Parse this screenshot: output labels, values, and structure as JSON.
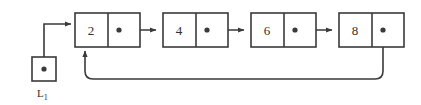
{
  "diagram": {
    "type": "circular-singly-linked-list",
    "colors": {
      "stroke": "#3a3a3a",
      "background": "#ffffff",
      "text": "#2f2f2f"
    },
    "header_pointer": {
      "label_base": "L",
      "label_subscript": "1",
      "label_full": "L₁",
      "box": {
        "x": 32,
        "y": 57,
        "w": 24,
        "h": 24
      },
      "dot": {
        "cx": 44,
        "cy": 69,
        "r": 2.6
      }
    },
    "nodes": [
      {
        "id": "node-1",
        "value": "2",
        "box": {
          "x": 75,
          "y": 13,
          "w": 65,
          "h": 34
        },
        "divider_x": 108,
        "dot": {
          "cx": 119,
          "cy": 30,
          "r": 2.6
        },
        "next": "node-2"
      },
      {
        "id": "node-2",
        "value": "4",
        "box": {
          "x": 163,
          "y": 13,
          "w": 65,
          "h": 34
        },
        "divider_x": 196,
        "dot": {
          "cx": 207,
          "cy": 30,
          "r": 2.6
        },
        "next": "node-3"
      },
      {
        "id": "node-3",
        "value": "6",
        "box": {
          "x": 251,
          "y": 13,
          "w": 65,
          "h": 34
        },
        "divider_x": 284,
        "dot": {
          "cx": 295,
          "cy": 30,
          "r": 2.6
        },
        "next": "node-4"
      },
      {
        "id": "node-4",
        "value": "8",
        "box": {
          "x": 339,
          "y": 13,
          "w": 65,
          "h": 34
        },
        "divider_x": 372,
        "dot": {
          "cx": 383,
          "cy": 30,
          "r": 2.6
        },
        "next": "node-1"
      }
    ],
    "edges": [
      {
        "id": "edge-header-to-node1",
        "from": "header_pointer",
        "to": "node-1",
        "style": "orthogonal",
        "path": "M 44 69 L 44 24 L 71 24",
        "arrow_at": {
          "x": 75,
          "y": 24
        }
      },
      {
        "id": "edge-node1-to-node2",
        "from": "node-1",
        "to": "node-2",
        "style": "straight",
        "path": "M 119 30 L 159 30",
        "arrow_at": {
          "x": 163,
          "y": 30
        }
      },
      {
        "id": "edge-node2-to-node3",
        "from": "node-2",
        "to": "node-3",
        "style": "straight",
        "path": "M 207 30 L 247 30",
        "arrow_at": {
          "x": 251,
          "y": 30
        }
      },
      {
        "id": "edge-node3-to-node4",
        "from": "node-3",
        "to": "node-4",
        "style": "straight",
        "path": "M 295 30 L 335 30",
        "arrow_at": {
          "x": 339,
          "y": 30
        }
      },
      {
        "id": "edge-node4-to-node1-wrap",
        "from": "node-4",
        "to": "node-1",
        "style": "rounded-wrap",
        "path": "M 383 30 L 383 72 Q 383 79 376 79 L 92 79 Q 85 79 85 72 L 85 52",
        "arrow_at": {
          "x": 85,
          "y": 47
        }
      }
    ]
  }
}
